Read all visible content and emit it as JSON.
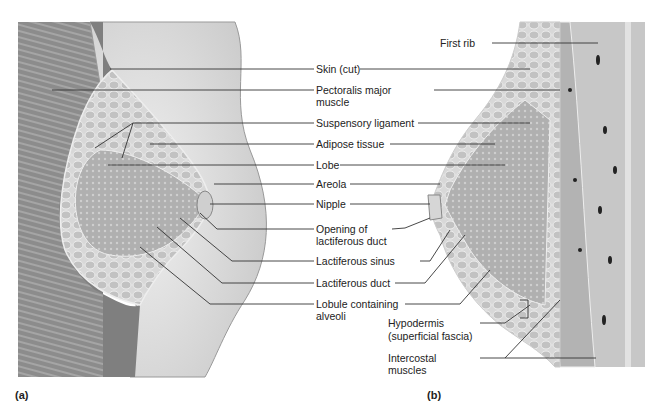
{
  "figure": {
    "panels": [
      {
        "id": "a",
        "label": "(a)"
      },
      {
        "id": "b",
        "label": "(b)"
      }
    ],
    "labels": [
      {
        "key": "skin",
        "text": "Skin (cut)"
      },
      {
        "key": "pectoralis_1",
        "text": "Pectoralis major"
      },
      {
        "key": "pectoralis_2",
        "text": "muscle"
      },
      {
        "key": "suspensory",
        "text": "Suspensory ligament"
      },
      {
        "key": "adipose",
        "text": "Adipose tissue"
      },
      {
        "key": "lobe",
        "text": "Lobe"
      },
      {
        "key": "areola",
        "text": "Areola"
      },
      {
        "key": "nipple",
        "text": "Nipple"
      },
      {
        "key": "opening_1",
        "text": "Opening of"
      },
      {
        "key": "opening_2",
        "text": "lactiferous duct"
      },
      {
        "key": "sinus",
        "text": "Lactiferous sinus"
      },
      {
        "key": "duct",
        "text": "Lactiferous duct"
      },
      {
        "key": "lobule_1",
        "text": "Lobule containing"
      },
      {
        "key": "lobule_2",
        "text": "alveoli"
      },
      {
        "key": "first_rib",
        "text": "First rib"
      },
      {
        "key": "hypodermis_1",
        "text": "Hypodermis"
      },
      {
        "key": "hypodermis_2",
        "text": "(superficial fascia)"
      },
      {
        "key": "intercostal_1",
        "text": "Intercostal"
      },
      {
        "key": "intercostal_2",
        "text": "muscles"
      }
    ]
  },
  "colors": {
    "line": "#333333",
    "muscle": "#8a8a8a",
    "skin": "#e6e6e6",
    "gland": "#b5b5b5",
    "fat": "#d4d4d4"
  }
}
